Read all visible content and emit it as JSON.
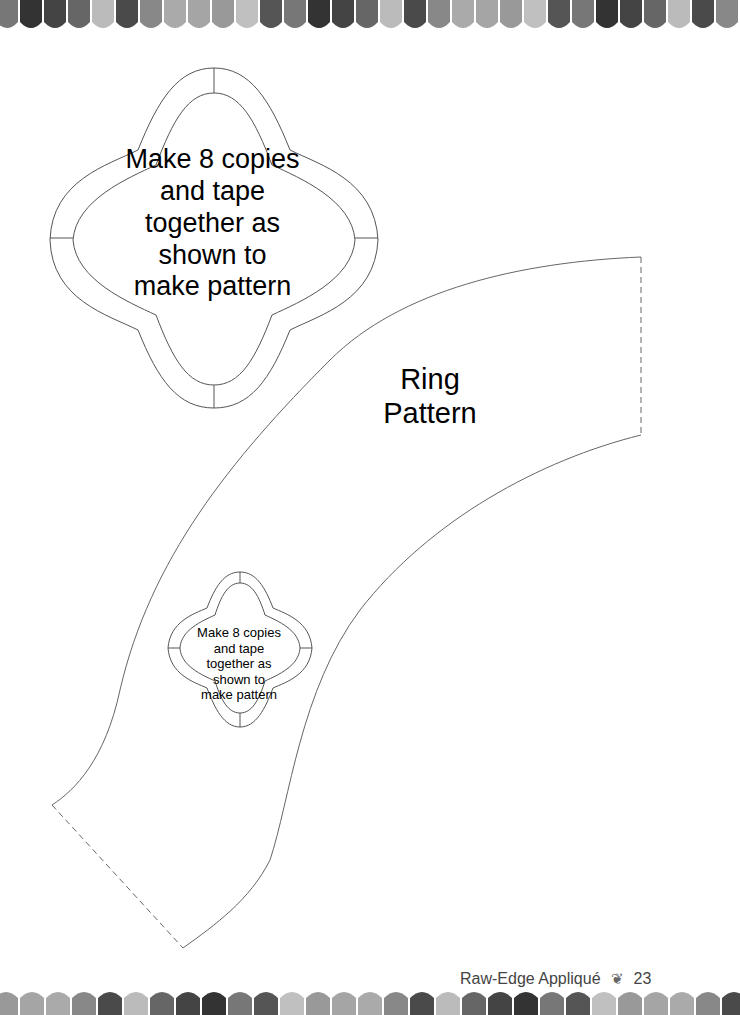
{
  "page": {
    "note_large": [
      "Make 8 copies",
      "and tape",
      "together as",
      "shown to",
      "make pattern"
    ],
    "note_small": [
      "Make 8 copies",
      "and tape",
      "together as",
      "shown to",
      "make pattern"
    ],
    "pattern_title": [
      "Ring",
      "Pattern"
    ],
    "footer": {
      "book_title": "Raw-Edge Appliqué",
      "ornament": "ornament-icon",
      "page_number": "23"
    }
  }
}
